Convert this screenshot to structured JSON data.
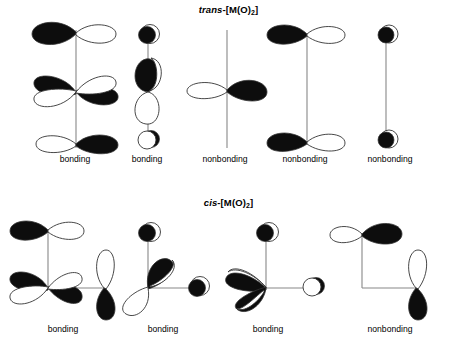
{
  "figure": {
    "width": 457,
    "height": 350,
    "background": "#ffffff",
    "ink": "#000000",
    "line_color": "#777777",
    "outline_color": "#444444"
  },
  "sections": [
    {
      "id": "trans",
      "title_prefix": "trans",
      "title_rest": "-[M(O)",
      "title_sub": "2",
      "title_suffix": "]",
      "title_full": "trans-[M(O)2]",
      "geometry": "linear O=M=O, vertical axis",
      "diagrams": [
        {
          "index": 0,
          "caption": "bonding",
          "center_x": 75,
          "caption_x": 75,
          "caption_y": 160,
          "metal_orbital": "d (four-lobe, dxz-like)",
          "ligand_orbitals": "two p orbitals, horizontal, one top one bottom",
          "description": "Vertical axis with top p-orbital (filled left lobe), central four-lobe d orbital (filled upper-left and lower-right), bottom p-orbital (filled right lobe)"
        },
        {
          "index": 1,
          "caption": "bonding",
          "center_x": 147,
          "caption_x": 147,
          "caption_y": 160,
          "metal_orbital": "d z2 / sp hybrid (two-lobe vertical)",
          "ligand_orbitals": "two s orbitals (circles), top filled, bottom half-filled",
          "description": "Vertical axis with top filled circle, center vertical two-lobe orbital (upper lobe filled, lower lobe open), bottom open circle"
        },
        {
          "index": 2,
          "caption": "nonbonding",
          "center_x": 225,
          "caption_x": 225,
          "caption_y": 160,
          "metal_orbital": "p (horizontal two-lobe)",
          "ligand_orbitals": "none",
          "description": "Bare vertical axis crossed by a horizontal two-lobe p orbital at center (right lobe filled, left lobe open)"
        },
        {
          "index": 3,
          "caption": "nonbonding",
          "center_x": 305,
          "caption_x": 305,
          "caption_y": 160,
          "metal_orbital": "none",
          "ligand_orbitals": "two p orbitals, horizontal, both with filled left lobe",
          "description": "Vertical axis with horizontal p orbital at top and bottom, both filled on the left lobe, no metal orbital"
        },
        {
          "index": 4,
          "caption": "nonbonding",
          "center_x": 390,
          "caption_x": 390,
          "caption_y": 160,
          "metal_orbital": "none",
          "ligand_orbitals": "two s orbitals (filled circles)",
          "description": "Vertical axis with filled circle at top and bottom, no metal orbital"
        }
      ]
    },
    {
      "id": "cis",
      "title_prefix": "cis",
      "title_rest": "-[M(O)",
      "title_sub": "2",
      "title_suffix": "]",
      "title_full": "cis-[M(O)2]",
      "geometry": "bent / L-shaped O-M-O, 90 degrees",
      "diagrams": [
        {
          "index": 0,
          "caption": "bonding",
          "center_x": 63,
          "caption_x": 63,
          "caption_y": 330,
          "metal_orbital": "d (four-lobe, dxy-like)",
          "ligand_orbitals": "p orbital at top (horizontal) and p orbital at right (vertical)",
          "description": "L-shaped axis: vertical arm up, horizontal arm right. Four-lobe d orbital at corner (filled upper-left, filled lower-right), top horizontal p orbital with filled left lobe, right vertical p orbital with filled lower lobe"
        },
        {
          "index": 1,
          "caption": "bonding",
          "center_x": 163,
          "caption_x": 163,
          "caption_y": 330,
          "metal_orbital": "p (diagonal two-lobe, tilted)",
          "ligand_orbitals": "s orbital top (filled circle), s orbital right (filled circle)",
          "description": "L-shaped axis with a diagonal two-lobe p orbital at corner (upper-right lobe filled, lower-left lobe open), filled circle at top, filled circle at right"
        },
        {
          "index": 2,
          "caption": "bonding",
          "center_x": 268,
          "caption_x": 268,
          "caption_y": 330,
          "metal_orbital": "p (diagonal two-lobe, tilted)",
          "ligand_orbitals": "s orbital top (filled circle), s orbital right (open circle)",
          "description": "L-shaped axis with diagonal two-lobe p orbital at corner (upper-left lobe filled, lower-right lobe filled dark), filled circle at top, open circle at right"
        },
        {
          "index": 3,
          "caption": "nonbonding",
          "center_x": 390,
          "caption_x": 390,
          "caption_y": 330,
          "metal_orbital": "none",
          "ligand_orbitals": "p orbital at top (horizontal, filled right lobe), p orbital at right (vertical, filled lower lobe)",
          "description": "L-shaped axis with no metal orbital; horizontal p orbital at top-left with filled right lobe and vertical p orbital at bottom-right with filled lower lobe"
        }
      ]
    }
  ]
}
